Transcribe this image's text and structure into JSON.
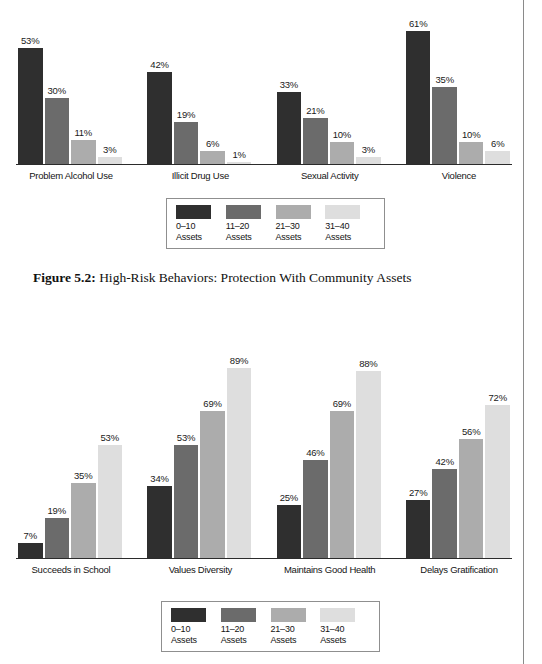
{
  "page": {
    "edge_rule_color": "#8a8a8a",
    "background": "#ffffff"
  },
  "series_colors": [
    "#2f2f2f",
    "#6b6b6b",
    "#acacac",
    "#dedede"
  ],
  "legend": {
    "items": [
      {
        "swatch": "#2f2f2f",
        "range": "0–10",
        "unit": "Assets"
      },
      {
        "swatch": "#6b6b6b",
        "range": "11–20",
        "unit": "Assets"
      },
      {
        "swatch": "#acacac",
        "range": "21–30",
        "unit": "Assets"
      },
      {
        "swatch": "#dedede",
        "range": "31–40",
        "unit": "Assets"
      }
    ]
  },
  "caption": {
    "number": "Figure 5.2:",
    "text": " High-Risk Behaviors: Protection With Community Assets"
  },
  "chart_data": [
    {
      "id": "high-risk-behaviors",
      "type": "bar",
      "title": "",
      "xlabel": "",
      "ylabel": "",
      "ylim": [
        0,
        75
      ],
      "grid": false,
      "legend_position": "bottom-center",
      "categories": [
        "Problem Alcohol Use",
        "Illicit Drug Use",
        "Sexual Activity",
        "Violence"
      ],
      "series": [
        {
          "name": "0–10 Assets",
          "color": "#2f2f2f",
          "values": [
            53,
            42,
            33,
            61
          ],
          "labels": [
            "53%",
            "42%",
            "33%",
            "61%"
          ]
        },
        {
          "name": "11–20 Assets",
          "color": "#6b6b6b",
          "values": [
            30,
            19,
            21,
            35
          ],
          "labels": [
            "30%",
            "19%",
            "21%",
            "35%"
          ]
        },
        {
          "name": "21–30 Assets",
          "color": "#acacac",
          "values": [
            11,
            6,
            10,
            10
          ],
          "labels": [
            "11%",
            "6%",
            "10%",
            "10%"
          ]
        },
        {
          "name": "31–40 Assets",
          "color": "#dedede",
          "values": [
            3,
            1,
            3,
            6
          ],
          "labels": [
            "3%",
            "1%",
            "3%",
            "6%"
          ]
        }
      ]
    },
    {
      "id": "thriving-indicators",
      "type": "bar",
      "title": "",
      "xlabel": "",
      "ylabel": "",
      "ylim": [
        0,
        107
      ],
      "grid": false,
      "legend_position": "bottom-center",
      "categories": [
        "Succeeds in School",
        "Values Diversity",
        "Maintains Good Health",
        "Delays Gratification"
      ],
      "series": [
        {
          "name": "0–10 Assets",
          "color": "#2f2f2f",
          "values": [
            7,
            34,
            25,
            27
          ],
          "labels": [
            "7%",
            "34%",
            "25%",
            "27%"
          ]
        },
        {
          "name": "11–20 Assets",
          "color": "#6b6b6b",
          "values": [
            19,
            53,
            46,
            42
          ],
          "labels": [
            "19%",
            "53%",
            "46%",
            "42%"
          ]
        },
        {
          "name": "21–30 Assets",
          "color": "#acacac",
          "values": [
            35,
            69,
            69,
            56
          ],
          "labels": [
            "35%",
            "69%",
            "69%",
            "56%"
          ]
        },
        {
          "name": "31–40 Assets",
          "color": "#dedede",
          "values": [
            53,
            89,
            88,
            72
          ],
          "labels": [
            "53%",
            "89%",
            "88%",
            "72%"
          ]
        }
      ]
    }
  ]
}
